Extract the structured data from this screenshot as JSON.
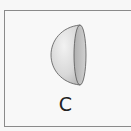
{
  "figure": {
    "label": "C",
    "shape": "hemisphere-icon",
    "colors": {
      "border": "#8a8a8a",
      "shape_light": "#e6e6e6",
      "shape_dark": "#bdbdbd",
      "face": "#c9c9c9",
      "outline": "#555555",
      "label": "#222222"
    }
  }
}
